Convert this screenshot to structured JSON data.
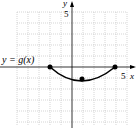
{
  "graph": {
    "function_label": "y = g(x)",
    "x_axis_label": "x",
    "y_axis_label": "y",
    "x_tick_label": "5",
    "y_tick_label": "5",
    "grid_range": {
      "xmin": -5,
      "xmax": 5,
      "ymin": -5,
      "ymax": 5
    },
    "points": [
      {
        "x": -2,
        "y": 0
      },
      {
        "x": 1,
        "y": -1
      },
      {
        "x": 4,
        "y": 0
      }
    ]
  }
}
